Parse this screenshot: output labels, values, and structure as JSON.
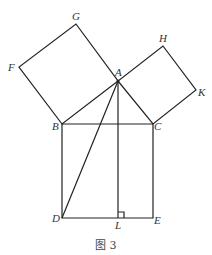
{
  "figure": {
    "caption": "图 3",
    "points": {
      "A": {
        "x": 118,
        "y": 81,
        "label": "A"
      },
      "B": {
        "x": 62,
        "y": 124,
        "label": "B"
      },
      "C": {
        "x": 153,
        "y": 124,
        "label": "C"
      },
      "D": {
        "x": 62,
        "y": 218,
        "label": "D"
      },
      "E": {
        "x": 153,
        "y": 218,
        "label": "E"
      },
      "F": {
        "x": 19,
        "y": 67,
        "label": "F"
      },
      "G": {
        "x": 76,
        "y": 24,
        "label": "G"
      },
      "H": {
        "x": 163,
        "y": 46,
        "label": "H"
      },
      "K": {
        "x": 196,
        "y": 90,
        "label": "K"
      },
      "L": {
        "x": 118,
        "y": 218,
        "label": "L"
      }
    }
  }
}
